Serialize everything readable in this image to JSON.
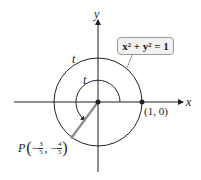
{
  "diagram": {
    "axes": {
      "x_label": "x",
      "y_label": "y"
    },
    "circle_equation": "x² + y² = 1",
    "arc_labels": {
      "outer": "t",
      "inner": "t"
    },
    "start_point": {
      "label": "(1, 0)"
    },
    "terminal_point": {
      "name": "P",
      "x_num": "3",
      "x_den": "5",
      "x_sign": "−",
      "y_num": "4",
      "y_den": "5",
      "y_sign": "−"
    },
    "colors": {
      "ink": "#231f20",
      "radius_segment": "#8c8c8c",
      "label_box_fill": "#f2f2f2",
      "label_box_border": "#9a9a9a"
    }
  }
}
